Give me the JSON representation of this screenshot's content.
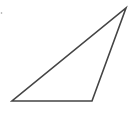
{
  "diagram": {
    "type": "geometric-figure",
    "shape": "triangle",
    "kind": "obtuse scalene triangle",
    "vertices": [
      {
        "x": 12,
        "y": 101
      },
      {
        "x": 92,
        "y": 101
      },
      {
        "x": 126,
        "y": 8
      }
    ],
    "stroke_color": "#444444",
    "stroke_width": 1.6,
    "fill": "none",
    "background": "#ffffff",
    "mark": {
      "x": 1.5,
      "y": 13,
      "color": "#9a9a9a"
    }
  }
}
